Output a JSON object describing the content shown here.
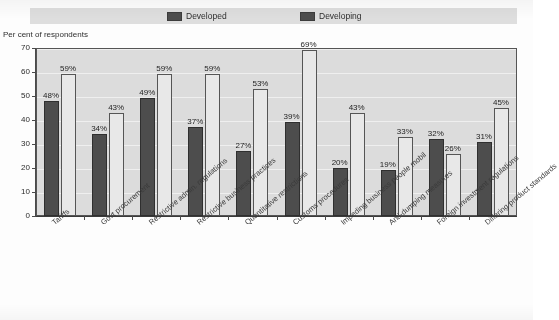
{
  "legend": {
    "developed_label": "Developed",
    "developing_label": "Developing",
    "developed_color": "#4d4d4d",
    "developing_color": "#e8e8e8"
  },
  "axis_caption": "Per cent of respondents",
  "chart_data": {
    "type": "bar",
    "title": "",
    "xlabel": "",
    "ylabel": "Per cent of respondents",
    "ylim": [
      0,
      70
    ],
    "yticks": [
      0,
      10,
      20,
      30,
      40,
      50,
      60,
      70
    ],
    "grid": true,
    "legend_position": "top",
    "categories": [
      "Tariffs",
      "Govt procurement",
      "Restrictive admin. regulations",
      "Restrictive business practices",
      "Quantitative restrictions",
      "Customs procedures",
      "Impeding business people mobil",
      "Anti-dumping measures",
      "Foreign investment regulations",
      "Differing product standards"
    ],
    "series": [
      {
        "name": "Developed",
        "values": [
          48,
          34,
          49,
          37,
          27,
          39,
          20,
          19,
          32,
          31
        ],
        "labels": [
          "48%",
          "34%",
          "49%",
          "37%",
          "27%",
          "39%",
          "20%",
          "19%",
          "32%",
          "31%"
        ]
      },
      {
        "name": "Developing",
        "values": [
          59,
          43,
          59,
          59,
          53,
          69,
          43,
          33,
          26,
          45
        ],
        "labels": [
          "59%",
          "43%",
          "59%",
          "59%",
          "53%",
          "69%",
          "43%",
          "33%",
          "26%",
          "45%"
        ]
      }
    ]
  },
  "ytick_labels": [
    "70",
    "60",
    "50",
    "40",
    "30",
    "20",
    "10",
    "0"
  ]
}
